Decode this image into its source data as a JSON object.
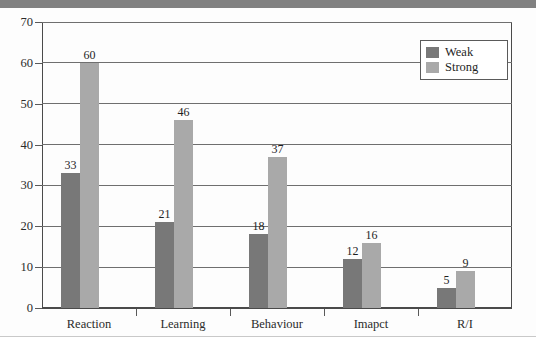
{
  "chart_data": {
    "type": "bar",
    "title": "",
    "subtitle": "",
    "xlabel": "",
    "ylabel": "",
    "categories": [
      "Reaction",
      "Learning",
      "Behaviour",
      "Imapct",
      "R/I"
    ],
    "series": [
      {
        "name": "Weak",
        "color": "#787878",
        "values": [
          33,
          21,
          18,
          12,
          5
        ]
      },
      {
        "name": "Strong",
        "color": "#a9a9a9",
        "values": [
          60,
          46,
          37,
          16,
          9
        ]
      }
    ],
    "ylim": [
      0,
      70
    ],
    "ytick_step": 10,
    "yticks": [
      0,
      10,
      20,
      30,
      40,
      50,
      60,
      70
    ],
    "ytick_labels": [
      "0",
      "10",
      "20",
      "30",
      "40",
      "50",
      "60",
      "70"
    ],
    "grid": "horizontal",
    "data_labels": true,
    "legend": {
      "position": "top-right-inside",
      "entries": [
        {
          "label": "Weak",
          "swatch": "#787878"
        },
        {
          "label": "Strong",
          "swatch": "#a9a9a9"
        }
      ]
    }
  },
  "page": {
    "background": "#ffffff",
    "top_band_color": "#818181",
    "axis_color": "#4a4a4a",
    "grid_color": "#6f6f6f"
  }
}
